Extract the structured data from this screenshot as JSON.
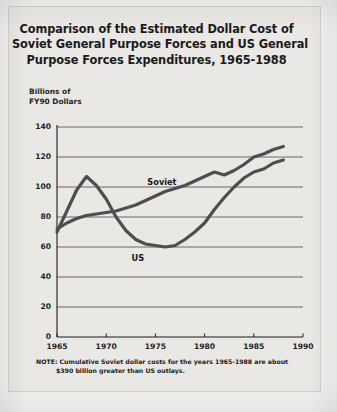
{
  "figure": {
    "title_lines": [
      "Comparison of the Estimated Dollar Cost of",
      "Soviet General Purpose Forces and US General",
      "Purpose Forces Expenditures, 1965-1988"
    ],
    "y_axis_caption_lines": [
      "Billions of",
      "FY90 Dollars"
    ],
    "note_lines": [
      "NOTE: Cumulative Soviet dollar costs for the years 1965-1988 are about",
      "$390 billion greater than US outlays."
    ]
  },
  "colors": {
    "page_background": "#f2f1ef",
    "card_background": "#e9e8e5",
    "card_border": "#d2d1cd",
    "axis": "#1d1d1d",
    "gridline": "#4a4a4a",
    "series_line": "#4e4e4e",
    "text": "#1b1b1b"
  },
  "chart_data": {
    "type": "line",
    "title": "Comparison of the Estimated Dollar Cost of Soviet General Purpose Forces and US General Purpose Forces Expenditures, 1965-1988",
    "xlabel": "",
    "ylabel": "Billions of FY90 Dollars",
    "xlim": [
      1965,
      1990
    ],
    "ylim": [
      0,
      140
    ],
    "xticks": [
      1965,
      1970,
      1975,
      1980,
      1985,
      1990
    ],
    "yticks": [
      0,
      20,
      40,
      60,
      80,
      100,
      120,
      140
    ],
    "grid": true,
    "legend": "inline-labels",
    "annotations": [
      {
        "text": "Soviet",
        "x": 1975.2,
        "y": 103
      },
      {
        "text": "US",
        "x": 1973.6,
        "y": 52
      }
    ],
    "x": [
      1965,
      1966,
      1967,
      1968,
      1969,
      1970,
      1971,
      1972,
      1973,
      1974,
      1975,
      1976,
      1977,
      1978,
      1979,
      1980,
      1981,
      1982,
      1983,
      1984,
      1985,
      1986,
      1987,
      1988
    ],
    "series": [
      {
        "name": "Soviet",
        "values": [
          72,
          76,
          79,
          81,
          82,
          83,
          84,
          86,
          88,
          91,
          94,
          97,
          99,
          101,
          104,
          107,
          110,
          108,
          111,
          115,
          120,
          122,
          125,
          127
        ]
      },
      {
        "name": "US",
        "values": [
          70,
          84,
          98,
          107,
          101,
          92,
          80,
          71,
          65,
          62,
          61,
          60,
          61,
          65,
          70,
          76,
          85,
          93,
          100,
          106,
          110,
          112,
          116,
          118
        ]
      }
    ]
  }
}
